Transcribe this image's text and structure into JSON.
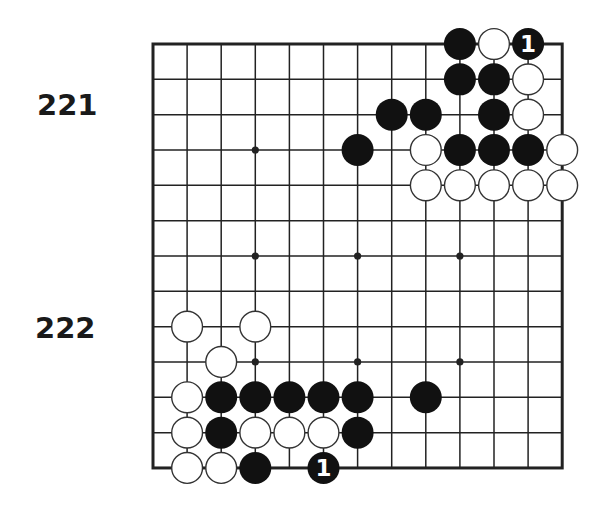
{
  "labels": [
    {
      "id": "221",
      "text": "221"
    },
    {
      "id": "222",
      "text": "222"
    }
  ],
  "board": {
    "columns": 13,
    "rows": 13,
    "origin_x": 153,
    "origin_y": 44,
    "spacing_x": 34.1,
    "spacing_y": 35.33,
    "stone_radius": 16,
    "line_color": "#222222",
    "border_width": 3,
    "line_width": 1.5,
    "hoshi": [
      [
        3,
        3
      ],
      [
        6,
        3
      ],
      [
        9,
        3
      ],
      [
        3,
        6
      ],
      [
        6,
        6
      ],
      [
        9,
        6
      ],
      [
        3,
        9
      ],
      [
        6,
        9
      ],
      [
        9,
        9
      ]
    ],
    "black_color": "#111111",
    "white_fill": "#ffffff",
    "white_stroke": "#333333"
  },
  "stones": [
    {
      "c": 9,
      "r": 0,
      "color": "black"
    },
    {
      "c": 10,
      "r": 0,
      "color": "white"
    },
    {
      "c": 11,
      "r": 0,
      "color": "black",
      "label": "1"
    },
    {
      "c": 9,
      "r": 1,
      "color": "black"
    },
    {
      "c": 10,
      "r": 1,
      "color": "black"
    },
    {
      "c": 11,
      "r": 1,
      "color": "white"
    },
    {
      "c": 7,
      "r": 2,
      "color": "black"
    },
    {
      "c": 8,
      "r": 2,
      "color": "black"
    },
    {
      "c": 10,
      "r": 2,
      "color": "black"
    },
    {
      "c": 11,
      "r": 2,
      "color": "white"
    },
    {
      "c": 6,
      "r": 3,
      "color": "black"
    },
    {
      "c": 8,
      "r": 3,
      "color": "white"
    },
    {
      "c": 9,
      "r": 3,
      "color": "black"
    },
    {
      "c": 10,
      "r": 3,
      "color": "black"
    },
    {
      "c": 11,
      "r": 3,
      "color": "black"
    },
    {
      "c": 12,
      "r": 3,
      "color": "white"
    },
    {
      "c": 8,
      "r": 4,
      "color": "white"
    },
    {
      "c": 9,
      "r": 4,
      "color": "white"
    },
    {
      "c": 10,
      "r": 4,
      "color": "white"
    },
    {
      "c": 11,
      "r": 4,
      "color": "white"
    },
    {
      "c": 12,
      "r": 4,
      "color": "white"
    },
    {
      "c": 1,
      "r": 8,
      "color": "white"
    },
    {
      "c": 3,
      "r": 8,
      "color": "white"
    },
    {
      "c": 2,
      "r": 9,
      "color": "white"
    },
    {
      "c": 1,
      "r": 10,
      "color": "white"
    },
    {
      "c": 2,
      "r": 10,
      "color": "black"
    },
    {
      "c": 3,
      "r": 10,
      "color": "black"
    },
    {
      "c": 4,
      "r": 10,
      "color": "black"
    },
    {
      "c": 5,
      "r": 10,
      "color": "black"
    },
    {
      "c": 6,
      "r": 10,
      "color": "black"
    },
    {
      "c": 8,
      "r": 10,
      "color": "black"
    },
    {
      "c": 1,
      "r": 11,
      "color": "white"
    },
    {
      "c": 2,
      "r": 11,
      "color": "black"
    },
    {
      "c": 3,
      "r": 11,
      "color": "white"
    },
    {
      "c": 4,
      "r": 11,
      "color": "white"
    },
    {
      "c": 5,
      "r": 11,
      "color": "white"
    },
    {
      "c": 6,
      "r": 11,
      "color": "black"
    },
    {
      "c": 1,
      "r": 12,
      "color": "white"
    },
    {
      "c": 2,
      "r": 12,
      "color": "white"
    },
    {
      "c": 3,
      "r": 12,
      "color": "black"
    },
    {
      "c": 5,
      "r": 12,
      "color": "black",
      "label": "1"
    }
  ]
}
